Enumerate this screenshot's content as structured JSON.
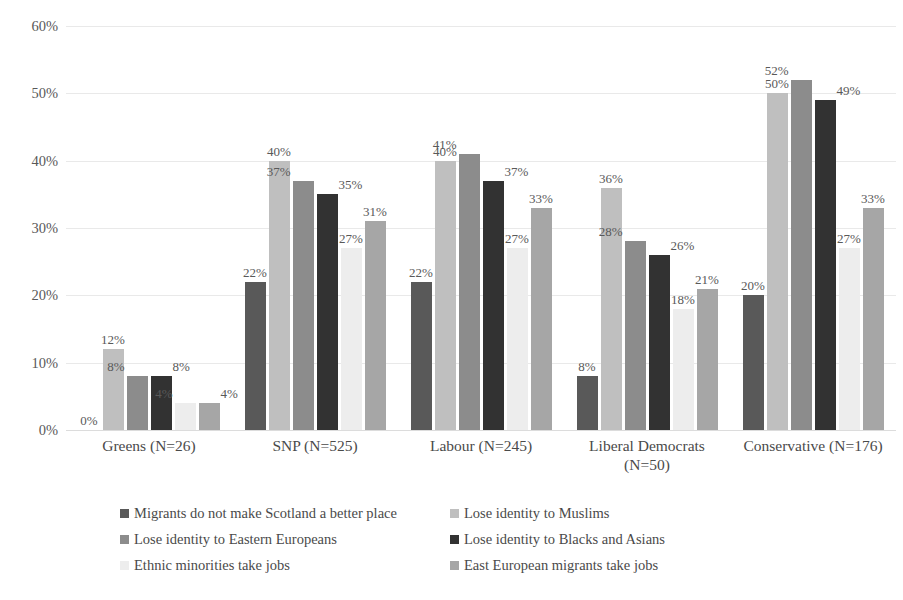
{
  "chart_data": {
    "type": "bar",
    "title": "",
    "subtitle": "",
    "xlabel": "",
    "ylabel": "",
    "ylim": [
      0,
      60
    ],
    "ytick_labels": [
      "0%",
      "10%",
      "20%",
      "30%",
      "40%",
      "50%",
      "60%"
    ],
    "ytick_values": [
      0,
      10,
      20,
      30,
      40,
      50,
      60
    ],
    "grid": true,
    "grid_axis": "y",
    "legend_position": "bottom",
    "value_labels": true,
    "value_label_suffix": "%",
    "categories": [
      "Greens (N=26)",
      "SNP (N=525)",
      "Labour (N=245)",
      "Liberal Democrats (N=50)",
      "Conservative (N=176)"
    ],
    "category_lines": [
      [
        "Greens (N=26)"
      ],
      [
        "SNP (N=525)"
      ],
      [
        "Labour (N=245)"
      ],
      [
        "Liberal Democrats",
        "(N=50)"
      ],
      [
        "Conservative (N=176)"
      ]
    ],
    "series": [
      {
        "name": "Migrants do not make Scotland a better place",
        "color": "#595959",
        "values": [
          0,
          22,
          22,
          8,
          20
        ],
        "labels": [
          "0%",
          "22%",
          "22%",
          "8%",
          "20%"
        ]
      },
      {
        "name": "Lose identity to Muslims",
        "color": "#bfbfbf",
        "values": [
          12,
          40,
          40,
          36,
          50
        ],
        "labels": [
          "12%",
          "40%",
          "40%",
          "36%",
          "50%"
        ]
      },
      {
        "name": "Lose identity to Eastern Europeans",
        "color": "#8c8c8c",
        "values": [
          8,
          37,
          41,
          28,
          52
        ],
        "labels": [
          "8%",
          "37%",
          "41%",
          "28%",
          "52%"
        ]
      },
      {
        "name": "Lose identity to Blacks and Asians",
        "color": "#323232",
        "values": [
          8,
          35,
          37,
          26,
          49
        ],
        "labels": [
          "8%",
          "35%",
          "37%",
          "26%",
          "49%"
        ]
      },
      {
        "name": "Ethnic minorities take jobs",
        "color": "#ededed",
        "values": [
          4,
          27,
          27,
          18,
          27
        ],
        "labels": [
          "4%",
          "27%",
          "27%",
          "18%",
          "27%"
        ]
      },
      {
        "name": "East European migrants take jobs",
        "color": "#a6a6a6",
        "values": [
          4,
          31,
          33,
          21,
          33
        ],
        "labels": [
          "4%",
          "31%",
          "33%",
          "21%",
          "33%"
        ]
      }
    ]
  },
  "legend": {
    "items": [
      "Migrants do not make Scotland a better place",
      "Lose identity to Muslims",
      "Lose identity to Eastern Europeans",
      "Lose identity to Blacks and Asians",
      "Ethnic minorities take jobs",
      "East European migrants take jobs"
    ]
  }
}
